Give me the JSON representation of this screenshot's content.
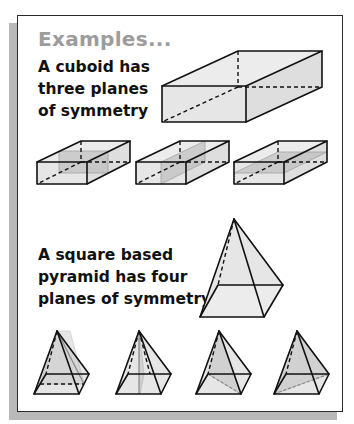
{
  "title": "Examples...",
  "examples": [
    {
      "shape": "cuboid",
      "caption_lines": [
        "A cuboid has",
        "three planes",
        "of symmetry"
      ],
      "planes_of_symmetry": 3
    },
    {
      "shape": "square-based-pyramid",
      "caption_lines": [
        "A square based",
        "pyramid has four",
        "planes of symmetry"
      ],
      "planes_of_symmetry": 4
    }
  ],
  "colors": {
    "title": "#9c9c9c",
    "text": "#111111",
    "face_fill": "#e6e6e6",
    "plane_fill": "#b8b8b8",
    "shadow": "#b9b9b9"
  }
}
